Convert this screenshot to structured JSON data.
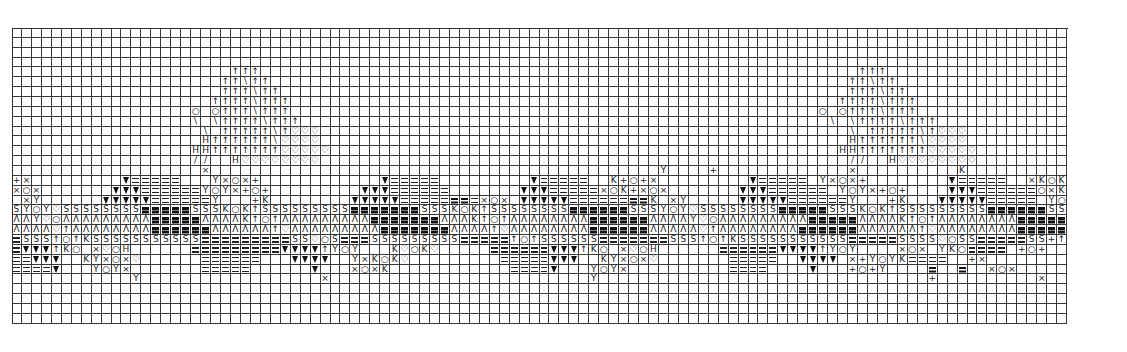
{
  "chart_data": {
    "type": "table",
    "title": "",
    "grid": {
      "columns": 106,
      "rows": 30,
      "cell_width_px": 9.96,
      "cell_height_px": 9.87,
      "gridline_color": "#3a3a3a",
      "background": "#ffffff"
    },
    "legend": {
      ".": "empty",
      "=": "double-bar stitch",
      "B": "heavy bar stitch",
      "v": "filled triangle",
      "A": "open triangle (inverted V)",
      "S": "S-shape stitch",
      "Y": "Y stitch",
      "X": "cross stitch",
      "o": "circle stitch",
      "+": "plus stitch",
      "K": "K stitch",
      "^": "up arrow stitch",
      "h": "heart / shield stitch",
      "/": "diagonal stitch",
      "\\": "back-diagonal stitch",
      "H": "H-bar stitch",
      "q": "antenna knob"
    },
    "rows": [
      "..........................................................................................................",
      "..........................................................................................................",
      "..........................................................................................................",
      "..........................................................................................................",
      "......................^^^............................................................^^^..................",
      ".....................^^\\^^..........................................................^^\\^^.................",
      ".....................^^^\\^^.........................................................^^^\\^^................",
      "....................^^^^\\^^^.......................................................^^^^\\^^^...............",
      "..................q.q^^^\\^^^.....................................................q.q^^^\\^^^...............",
      "..................\\.\\^^^^\\^^^.....................................................\\.\\^^^^\\^^^..............",
      "...................\\.^^^^^\\^hhh.....................................................\\.^^^^^\\^hhh...........",
      "...................H^^^^^^\\hhhh.....................................................H^^^^^^\\hhhh..........",
      "..................HH^^^^^^^hhhhh...................................................HH^^^^^^^hhhhh.........",
      "..................//..Hhhhhhhhh.....................................................//..Hhhhhhhhh..........",
      "...................X.............................................Y....+.............X..........K...........",
      "+X.........v=====...YXoX+............v=====.........v=====..K+o+X.........v=====.YXoX+........v=====..XKoK..",
      "XoX.......vvv======YoYX+o+.........vvv======.......vvv=====XoK+XoX.......vvv======.YoYX+o+....vvv======oXKY..",
      ".XY......vvvvv======Y...+K........vvvvv=====BB=XoX.vvvvv======BBK.XY.....vvvvv======Y...+K...vvvvv=====.YoY...",
      "SYoYhSSSSSSSSBBBBBSSSKoK^SSSSSSSSSBBBBBBBSSSKoK^SSSSSSSSBBBBBBSSSYoYhSSSSSSSSBBBBBSSSKoK^SSSSSSSSSBBBBBBSShYSSS.",
      "AAYhoAAAAAAAAABBBBBAAAAK^o^AAAAAAAAABBBBBBBAAAK^o^AAAAAAAABBBBBBAAAAYhoAAAAAAAAABBBBBAAAAK^o^AAAAAAAABBBBBBBhoh^AA",
      "AAAAh^AAAAAAAABBBBBBAAAAAA^hAAAAAAAAABBBBBBBAAAA^hAAAAAAAABBBBBBAAAAAh^AAAAAAAABBBBBBAAAAAA^hAAAAAAAABBBBBBAhh^oA^",
      "=SSS^o^KSSSSSSSSSSS=========SShoS===SSSSSSSSS=====^o^SSSSSS=======SSS^o^KSSSSSSSSSSS=====SSSShoSS=====SS+^S...",
      "=vvv^Ko.XhoH......=========vvvv^YoY...KhoKh.....======vvv^Ko.XhoH......======vvvv^YoY....XoX.YKo====.+o+.....",
      "==vvv..KYXoXh......======...vvvv..YXKoKh.........=====vvv..KYXoXh.......=====..vvvv.X+YoYK====..+X....",
      "====v...YoYX.......=====......v...XoXK............====v...YoYX..........====....v...+o+Y....B..B..XoX...",
      "............Y..................X..........................Y.................................+..........X....",
      "..........................................................................................................",
      "..........................................................................................................",
      "..........................................................................................................",
      ".........................................................................................................."
    ]
  }
}
